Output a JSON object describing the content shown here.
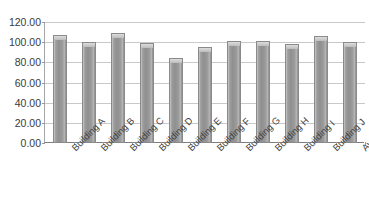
{
  "chart_data": {
    "type": "bar",
    "title": "",
    "subtitle": "",
    "xlabel": "",
    "ylabel": "",
    "ylim": [
      0,
      120
    ],
    "ytick_step": 20,
    "ytick_labels": [
      "0.00",
      "20.00",
      "40.00",
      "60.00",
      "80.00",
      "100.00",
      "120.00"
    ],
    "ytick_values": [
      0,
      20,
      40,
      60,
      80,
      100,
      120
    ],
    "grid": "horizontal",
    "legend": "none",
    "number_format": "0.00",
    "categories": [
      "Building A",
      "Building B",
      "Building C",
      "Building D",
      "Building E",
      "Building F",
      "Building G",
      "Building H",
      "Building I",
      "Building J",
      "Average"
    ],
    "values": [
      107,
      100,
      109,
      99,
      84,
      95,
      101,
      101,
      98,
      106,
      100
    ],
    "series": [
      {
        "name": "",
        "values": [
          107,
          100,
          109,
          99,
          84,
          95,
          101,
          101,
          98,
          106,
          100
        ]
      }
    ],
    "annotations": [],
    "colors": {
      "bar_fill": "#9b9b9b",
      "bar_border": "#8a8a8a",
      "bar_highlight": "#c9c9c9",
      "gridline": "#c9c9c9",
      "axis": "#7f7f7f",
      "tick_label": "#3a3a3a",
      "category_label": "#3f3f3f",
      "background": "#ffffff"
    }
  }
}
